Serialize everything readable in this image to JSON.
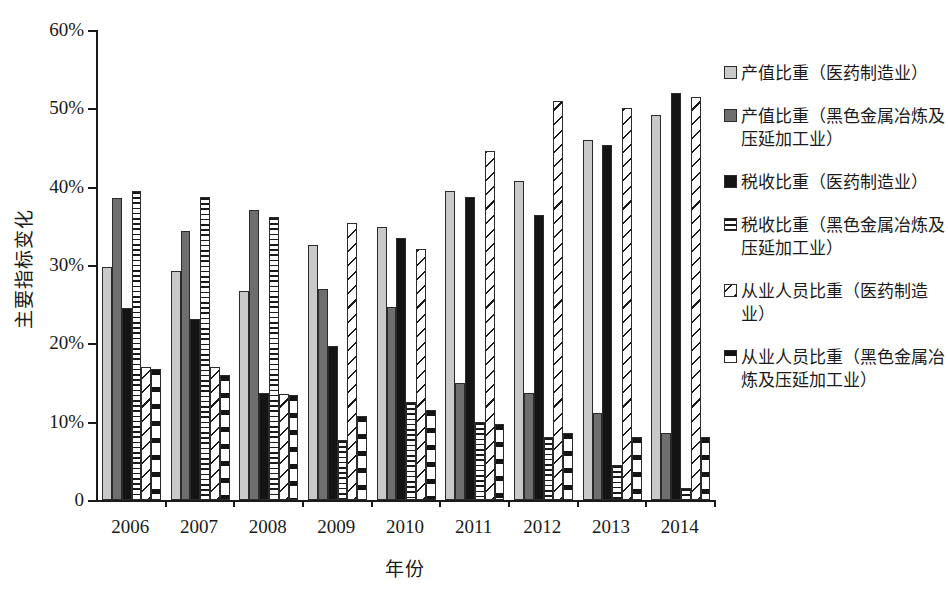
{
  "chart_data": {
    "type": "bar",
    "title": "",
    "xlabel": "年份",
    "ylabel": "主要指标变化",
    "categories": [
      "2006",
      "2007",
      "2008",
      "2009",
      "2010",
      "2011",
      "2012",
      "2013",
      "2014"
    ],
    "ylim": [
      0,
      60
    ],
    "ytick_labels": [
      "0",
      "10%",
      "20%",
      "30%",
      "40%",
      "50%",
      "60%"
    ],
    "ytick_values": [
      0,
      10,
      20,
      30,
      40,
      50,
      60
    ],
    "y_unit": "%",
    "grid": false,
    "legend_position": "right",
    "series": [
      {
        "name": "产值比重（医药制造业）",
        "pattern": "light-gray-solid",
        "values": [
          29.7,
          29.2,
          26.7,
          32.5,
          34.8,
          39.5,
          40.7,
          46.0,
          49.2
        ]
      },
      {
        "name": "产值比重（黑色金属冶炼及压延加工业）",
        "pattern": "dark-gray-solid",
        "values": [
          38.5,
          34.4,
          37.0,
          27.0,
          24.7,
          14.9,
          13.6,
          11.1,
          8.5
        ]
      },
      {
        "name": "税收比重（医药制造业）",
        "pattern": "black-solid",
        "values": [
          24.5,
          23.1,
          13.7,
          19.7,
          33.4,
          38.7,
          36.4,
          45.3,
          52.0
        ]
      },
      {
        "name": "税收比重（黑色金属冶炼及压延加工业）",
        "pattern": "horizontal-lines",
        "values": [
          39.5,
          38.7,
          36.1,
          7.7,
          12.5,
          10.0,
          8.1,
          4.5,
          1.5
        ]
      },
      {
        "name": "从业人员比重（医药制造业）",
        "pattern": "diagonal-lines",
        "values": [
          17.0,
          17.0,
          13.5,
          35.3,
          32.0,
          44.6,
          51.0,
          50.0,
          51.5
        ]
      },
      {
        "name": "从业人员比重（黑色金属冶炼及压延加工业）",
        "pattern": "black-band",
        "values": [
          16.7,
          15.9,
          13.4,
          10.7,
          11.5,
          9.7,
          8.6,
          8.0,
          8.1
        ]
      }
    ]
  },
  "legend": {
    "entries": [
      {
        "label": "产值比重（医药制造业）",
        "swatch": "light-gray-swatch-icon"
      },
      {
        "label": "产值比重（黑色金属冶炼及压延加工业）",
        "swatch": "dark-gray-swatch-icon"
      },
      {
        "label": "税收比重（医药制造业）",
        "swatch": "black-swatch-icon"
      },
      {
        "label": "税收比重（黑色金属冶炼及压延加工业）",
        "swatch": "horizontal-lines-swatch-icon"
      },
      {
        "label": "从业人员比重（医药制造业）",
        "swatch": "diagonal-lines-swatch-icon"
      },
      {
        "label": "从业人员比重（黑色金属冶炼及压延加工业）",
        "swatch": "black-band-swatch-icon"
      }
    ]
  }
}
